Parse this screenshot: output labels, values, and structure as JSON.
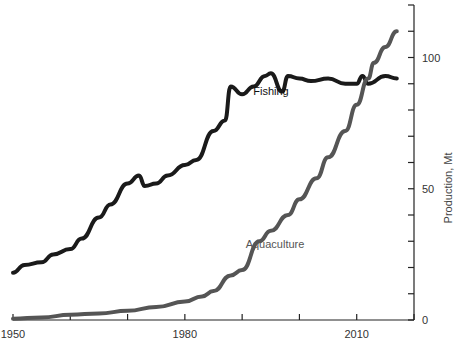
{
  "chart_data": {
    "type": "line",
    "title": "",
    "xlabel": "",
    "ylabel": "Production, Mt",
    "xlim": [
      1950,
      2020
    ],
    "ylim": [
      0,
      120
    ],
    "x_ticks": [
      1950,
      1960,
      1970,
      1980,
      1990,
      2000,
      2010,
      2020
    ],
    "x_tick_labels": [
      "1950",
      "1980",
      "2010"
    ],
    "y_ticks": [
      0,
      10,
      20,
      30,
      40,
      50,
      60,
      70,
      80,
      90,
      100,
      110,
      120
    ],
    "y_tick_labels": [
      "0",
      "50",
      "100"
    ],
    "y_axis_position": "right",
    "grid": false,
    "legend": "inline labels",
    "series": [
      {
        "name": "Fishing",
        "color": "#1a1a1a",
        "label_pos": {
          "x": 271,
          "y": 95
        },
        "x": [
          1950,
          1952,
          1955,
          1957,
          1960,
          1962,
          1965,
          1967,
          1970,
          1972,
          1973,
          1975,
          1977,
          1980,
          1982,
          1985,
          1987,
          1988,
          1990,
          1992,
          1994,
          1995,
          1997,
          1998,
          2000,
          2002,
          2005,
          2008,
          2010,
          2011,
          2012,
          2015,
          2017
        ],
        "values": [
          18,
          21,
          22,
          25,
          27,
          31,
          39,
          44,
          52,
          55,
          51,
          52,
          55,
          59,
          61,
          72,
          76,
          89,
          86,
          89,
          93,
          94,
          87,
          93,
          92,
          91,
          92,
          90,
          90,
          93,
          90,
          93,
          92
        ]
      },
      {
        "name": "Aquaculture",
        "color": "#555555",
        "label_pos": {
          "x": 275,
          "y": 248
        },
        "x": [
          1950,
          1955,
          1960,
          1965,
          1970,
          1975,
          1980,
          1983,
          1985,
          1988,
          1990,
          1993,
          1995,
          1998,
          2000,
          2003,
          2005,
          2008,
          2010,
          2012,
          2013,
          2015,
          2017
        ],
        "values": [
          0.5,
          1,
          2,
          2.5,
          3.5,
          5,
          7,
          9,
          11,
          17,
          19,
          30,
          34,
          40,
          46,
          54,
          62,
          72,
          82,
          92,
          98,
          104,
          110
        ]
      }
    ]
  }
}
